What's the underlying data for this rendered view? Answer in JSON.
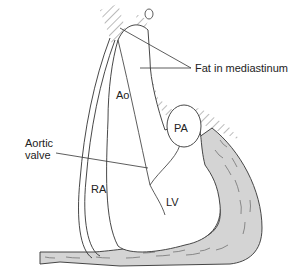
{
  "diagram": {
    "labels": {
      "ao": "Ao",
      "pa": "PA",
      "ra": "RA",
      "lv": "LV",
      "fat": "Fat in mediastinum",
      "aortic_valve_line1": "Aortic",
      "aortic_valve_line2": "valve"
    },
    "colors": {
      "line": "#333333",
      "muscle_fill": "#d4d4d4",
      "background": "#ffffff"
    }
  }
}
